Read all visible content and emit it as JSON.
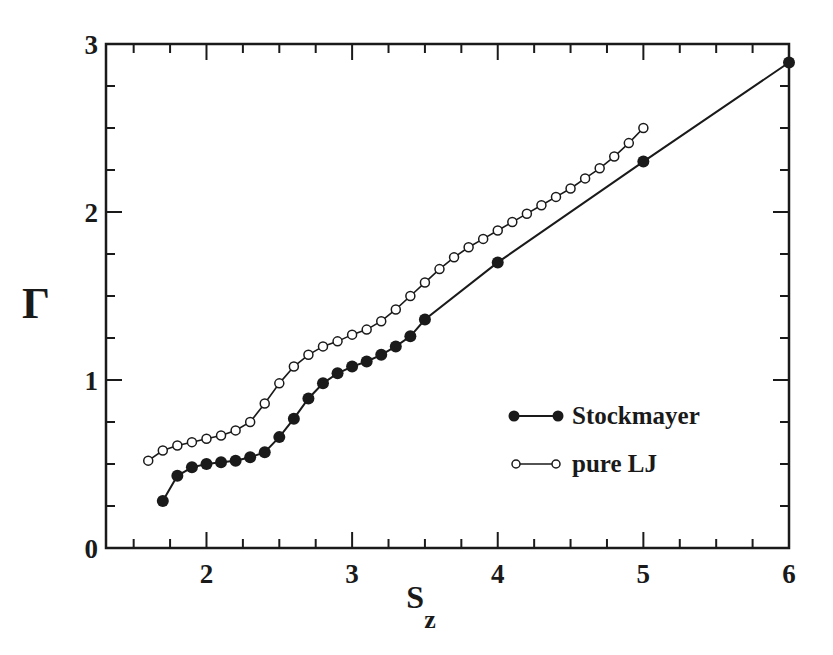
{
  "chart_data": {
    "type": "line",
    "title": "",
    "xlabel": "S",
    "xlabel_subscript": "z",
    "ylabel": "Γ",
    "xlim": [
      1.31,
      6.0
    ],
    "ylim": [
      0,
      3
    ],
    "x_ticks": [
      2,
      3,
      4,
      5,
      6
    ],
    "x_minor_step": 0.25,
    "y_ticks": [
      0,
      1,
      2,
      3
    ],
    "y_minor_step": 0.25,
    "grid": false,
    "legend_position": "lower right (inside)",
    "series": [
      {
        "name": "Stockmayer",
        "marker": "filled-circle",
        "x": [
          1.7,
          1.8,
          1.9,
          2.0,
          2.1,
          2.2,
          2.3,
          2.4,
          2.5,
          2.6,
          2.7,
          2.8,
          2.9,
          3.0,
          3.1,
          3.2,
          3.3,
          3.4,
          3.5,
          4.0,
          5.0,
          6.0
        ],
        "values": [
          0.28,
          0.43,
          0.48,
          0.5,
          0.51,
          0.52,
          0.54,
          0.57,
          0.66,
          0.77,
          0.89,
          0.98,
          1.04,
          1.08,
          1.11,
          1.15,
          1.2,
          1.26,
          1.36,
          1.7,
          2.3,
          2.89
        ]
      },
      {
        "name": "pure LJ",
        "marker": "open-circle",
        "x": [
          1.6,
          1.7,
          1.8,
          1.9,
          2.0,
          2.1,
          2.2,
          2.3,
          2.4,
          2.5,
          2.6,
          2.7,
          2.8,
          2.9,
          3.0,
          3.1,
          3.2,
          3.3,
          3.4,
          3.5,
          3.6,
          3.7,
          3.8,
          3.9,
          4.0,
          4.1,
          4.2,
          4.3,
          4.4,
          4.5,
          4.6,
          4.7,
          4.8,
          4.9,
          5.0
        ],
        "values": [
          0.52,
          0.58,
          0.61,
          0.63,
          0.65,
          0.67,
          0.7,
          0.75,
          0.86,
          0.98,
          1.08,
          1.15,
          1.2,
          1.23,
          1.27,
          1.3,
          1.35,
          1.42,
          1.5,
          1.58,
          1.66,
          1.73,
          1.79,
          1.84,
          1.89,
          1.94,
          1.99,
          2.04,
          2.09,
          2.14,
          2.2,
          2.26,
          2.33,
          2.41,
          2.5
        ]
      }
    ]
  },
  "legend": {
    "items": [
      {
        "label": "Stockmayer",
        "marker": "filled-circle"
      },
      {
        "label": "pure LJ",
        "marker": "open-circle"
      }
    ]
  },
  "axes": {
    "x_tick_labels": [
      "2",
      "3",
      "4",
      "5",
      "6"
    ],
    "y_tick_labels": [
      "0",
      "1",
      "2",
      "3"
    ],
    "xlabel": "S",
    "xlabel_sub": "z",
    "ylabel": "Γ"
  }
}
